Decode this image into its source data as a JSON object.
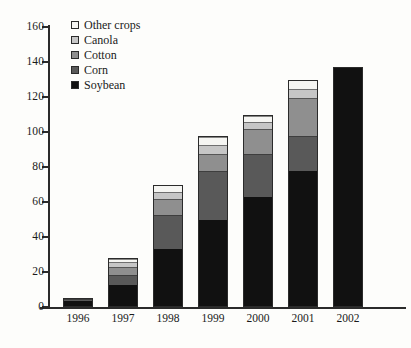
{
  "chart_data": {
    "type": "bar",
    "stacked": true,
    "title": "",
    "subtitle": "",
    "xlabel": "",
    "ylabel": "",
    "categories": [
      "1996",
      "1997",
      "1998",
      "1999",
      "2000",
      "2001",
      "2002"
    ],
    "ylim": [
      0,
      160
    ],
    "yticks": [
      0,
      20,
      40,
      60,
      80,
      100,
      120,
      140,
      160
    ],
    "ytick_labels": [
      "0",
      "20",
      "40",
      "60",
      "80",
      "100",
      "120",
      "140",
      "160"
    ],
    "grid": false,
    "legend_position": "upper-left-inside",
    "series": [
      {
        "name": "Soybean",
        "color": "#111111",
        "values": [
          4,
          12.5,
          33,
          50,
          63,
          78,
          137
        ]
      },
      {
        "name": "Corn",
        "color": "#595959",
        "values": [
          1,
          6,
          20,
          28,
          25,
          20,
          0
        ]
      },
      {
        "name": "Cotton",
        "color": "#8f8f8f",
        "values": [
          0,
          5,
          9,
          10,
          14,
          22,
          0
        ]
      },
      {
        "name": "Canola",
        "color": "#c6c6c6",
        "values": [
          0,
          3,
          4,
          5,
          4,
          5,
          0
        ]
      },
      {
        "name": "Other crops",
        "color": "#f5f5f2",
        "values": [
          0,
          1.5,
          4,
          5,
          4,
          5,
          0
        ]
      }
    ],
    "totals": [
      5,
      28,
      70,
      98,
      110,
      130,
      137
    ]
  },
  "legend": {
    "items": [
      {
        "label": "Other crops",
        "color": "#f5f5f2"
      },
      {
        "label": "Canola",
        "color": "#c6c6c6"
      },
      {
        "label": "Cotton",
        "color": "#8f8f8f"
      },
      {
        "label": "Corn",
        "color": "#595959"
      },
      {
        "label": "Soybean",
        "color": "#111111"
      }
    ]
  },
  "axis": {
    "y_label_texts": [
      "160",
      "140",
      "120",
      "100",
      "80",
      "60",
      "40",
      "20",
      "0"
    ],
    "x_label_texts": [
      "1996",
      "1997",
      "1998",
      "1999",
      "2000",
      "2001",
      "2002"
    ]
  }
}
